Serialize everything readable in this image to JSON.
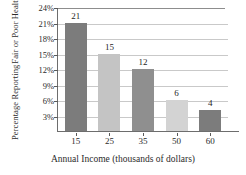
{
  "chart_data": {
    "type": "bar",
    "title": "",
    "subtitle": "",
    "categories": [
      "15",
      "25",
      "35",
      "50",
      "60"
    ],
    "values": [
      21,
      15,
      12,
      6,
      4
    ],
    "data_labels": [
      "21",
      "15",
      "12",
      "6",
      "4"
    ],
    "xlabel": "Annual Income (thousands of dollars)",
    "ylabel_line1": "Percentage Reporting",
    "ylabel_line2": "Fair or Poor Health",
    "ylim": [
      0,
      24
    ],
    "ytick_values": [
      3,
      6,
      9,
      12,
      15,
      18,
      21,
      24
    ],
    "ytick_labels": [
      "3%",
      "6%",
      "9%",
      "12%",
      "15%",
      "18%",
      "21%",
      "24%"
    ],
    "grid": true,
    "legend": "none",
    "bar_colors": [
      "#7c7c7c",
      "#c4c4c4",
      "#8f8f8f",
      "#d3d3d3",
      "#7c7c7c"
    ],
    "series": [
      {
        "name": "Percentage Reporting Fair or Poor Health",
        "values": [
          21,
          15,
          12,
          6,
          4
        ]
      }
    ],
    "points": [
      {
        "category": "15",
        "value": 21,
        "label": "21",
        "color": "#7c7c7c"
      },
      {
        "category": "25",
        "value": 15,
        "label": "15",
        "color": "#c4c4c4"
      },
      {
        "category": "35",
        "value": 12,
        "label": "12",
        "color": "#8f8f8f"
      },
      {
        "category": "50",
        "value": 6,
        "label": "6",
        "color": "#d3d3d3"
      },
      {
        "category": "60",
        "value": 4,
        "label": "4",
        "color": "#7c7c7c"
      }
    ],
    "axis_color": "#6d6d6d",
    "grid_color": "#c9c9c9",
    "text_color": "#2b2b2b",
    "background": "#ffffff"
  }
}
